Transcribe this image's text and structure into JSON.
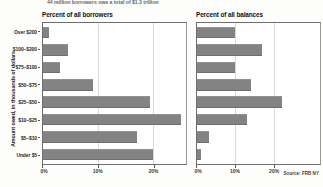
{
  "caption": "44 million borrowers owe a total of $1.3 trillion",
  "axis_title": "Amount owed, in thousands of dollars",
  "source": "Source: FRB NY",
  "panels": {
    "left_title": "Percent of all borrowers",
    "right_title": "Percent of all balances"
  },
  "chart_data": [
    {
      "type": "bar",
      "orientation": "horizontal",
      "title": "Percent of all borrowers",
      "xlabel": "",
      "ylabel": "Amount owed, in thousands of dollars",
      "categories": [
        "Over $200",
        "$100–$200",
        "$75–$100",
        "$50–$75",
        "$25–$50",
        "$10–$25",
        "$5–$10",
        "Under $5"
      ],
      "values": [
        1,
        4.5,
        3,
        9,
        19.5,
        25,
        17,
        20
      ],
      "xlim": [
        0,
        26
      ],
      "xticks": [
        0,
        10,
        20
      ],
      "xticklabels": [
        "0%",
        "10%",
        "20%"
      ],
      "grid": true,
      "legend": "none",
      "bar_color": "#838383"
    },
    {
      "type": "bar",
      "orientation": "horizontal",
      "title": "Percent of all balances",
      "xlabel": "",
      "ylabel": "Amount owed, in thousands of dollars",
      "categories": [
        "Over $200",
        "$100–$200",
        "$75–$100",
        "$50–$75",
        "$25–$50",
        "$10–$25",
        "$5–$10",
        "Under $5"
      ],
      "values": [
        10,
        17,
        10,
        14,
        22,
        13,
        3,
        1
      ],
      "xlim": [
        0,
        32
      ],
      "xticks": [
        0,
        10,
        20
      ],
      "xticklabels": [
        "0%",
        "10%",
        "20%"
      ],
      "grid": true,
      "legend": "none",
      "bar_color": "#838383",
      "source": "Source: FRB NY"
    }
  ]
}
